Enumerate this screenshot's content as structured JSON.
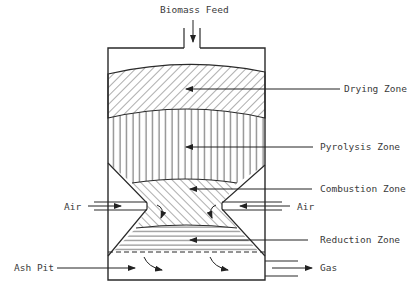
{
  "labels": {
    "feed": "Biomass Feed",
    "drying": "Drying Zone",
    "pyrolysis": "Pyrolysis Zone",
    "combustion": "Combustion Zone",
    "reduction": "Reduction Zone",
    "air_left": "Air",
    "air_right": "Air",
    "ash_pit": "Ash Pit",
    "gas": "Gas"
  },
  "colors": {
    "line": "#2a2a2a",
    "text": "#3a3a3a",
    "background": "#ffffff"
  }
}
